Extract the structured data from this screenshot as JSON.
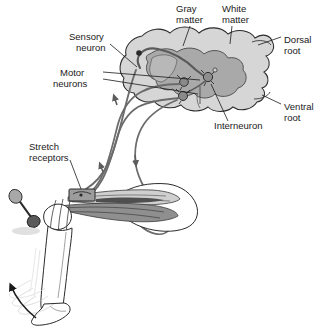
{
  "figure": {
    "background_color": "#ffffff"
  },
  "labels": [
    {
      "id": "gray-matter",
      "line1": "Gray",
      "line2": "matter",
      "x": 176,
      "y": 10,
      "anchor": "start"
    },
    {
      "id": "white-matter",
      "line1": "White",
      "line2": "matter",
      "x": 222,
      "y": 10,
      "anchor": "start"
    },
    {
      "id": "dorsal-root",
      "line1": "Dorsal",
      "line2": "root",
      "x": 283,
      "y": 41,
      "anchor": "start"
    },
    {
      "id": "ventral-root",
      "line1": "Ventral",
      "line2": "root",
      "x": 283,
      "y": 108,
      "anchor": "start"
    },
    {
      "id": "sensory-neuron",
      "line1": "Sensory",
      "line2": "neuron",
      "x": 70,
      "y": 38,
      "anchor": "start"
    },
    {
      "id": "motor-neurons",
      "line1": "Motor",
      "line2": "neurons",
      "x": 60,
      "y": 76,
      "anchor": "start"
    },
    {
      "id": "interneuron",
      "line1": "Interneuron",
      "line2": "",
      "x": 214,
      "y": 126,
      "anchor": "start"
    },
    {
      "id": "stretch-receptors",
      "line1": "Stretch",
      "line2": "receptors",
      "x": 28,
      "y": 148,
      "anchor": "start"
    }
  ],
  "leaders": [
    {
      "id": "gray-matter-leader",
      "d": "M 190 26 L 183 46"
    },
    {
      "id": "white-matter-leader",
      "d": "M 232 26 L 230 44"
    },
    {
      "id": "dorsal-root-leader",
      "d": "M 281 37 L 258 45"
    },
    {
      "id": "ventral-root-leader",
      "d": "M 281 104 L 262 95"
    },
    {
      "id": "sensory-neuron-leader",
      "d": "M 110 44 L 136 68"
    },
    {
      "id": "motor-neurons-leader-1",
      "d": "M 103 72 L 200 80"
    },
    {
      "id": "motor-neurons-leader-2",
      "d": "M 103 79 L 198 94"
    },
    {
      "id": "interneuron-leader",
      "d": "M 228 121 L 210 84"
    },
    {
      "id": "stretch-receptors-leader",
      "d": "M 70 160 L 82 190"
    }
  ],
  "colors": {
    "outline": "#2b2b2b",
    "white_matter": "#d4d4d4",
    "gray_matter": "#a8a8a8",
    "nerve": "#6b6b6b",
    "muscle_dark": "#8a8a8a",
    "muscle_light": "#cfcfcf",
    "ghost": "#c8c8c8",
    "receptor_fill": "#9a9a9a",
    "label_text": "#1a1a1a"
  },
  "structures": [
    {
      "id": "spinal-cord-cross-section",
      "name": "Spinal cord cross section"
    },
    {
      "id": "gray-matter-region",
      "name": "Gray matter (butterfly)"
    },
    {
      "id": "white-matter-region",
      "name": "White matter (outer)"
    },
    {
      "id": "dorsal-root-branch",
      "name": "Dorsal root"
    },
    {
      "id": "ventral-root-branch",
      "name": "Ventral root"
    },
    {
      "id": "dorsal-root-ganglion",
      "name": "Dorsal root ganglion"
    },
    {
      "id": "sensory-neuron-fiber",
      "name": "Sensory neuron fiber"
    },
    {
      "id": "motor-neuron-fiber-1",
      "name": "Motor neuron fiber 1"
    },
    {
      "id": "motor-neuron-fiber-2",
      "name": "Motor neuron fiber 2"
    },
    {
      "id": "interneuron-cell",
      "name": "Interneuron cell body"
    },
    {
      "id": "motor-cell-body-1",
      "name": "Motor neuron cell body 1"
    },
    {
      "id": "motor-cell-body-2",
      "name": "Motor neuron cell body 2"
    },
    {
      "id": "quadriceps-muscle",
      "name": "Quadriceps muscle"
    },
    {
      "id": "hamstring-muscle",
      "name": "Hamstring muscle"
    },
    {
      "id": "muscle-spindle",
      "name": "Muscle spindle / stretch receptor"
    },
    {
      "id": "leg-outline",
      "name": "Leg and foot outline"
    },
    {
      "id": "foot-motion-ghosts",
      "name": "Foot kick motion blur"
    },
    {
      "id": "motion-arrow",
      "name": "Foot kick direction arrow"
    },
    {
      "id": "reflex-hammer",
      "name": "Reflex hammer"
    }
  ]
}
